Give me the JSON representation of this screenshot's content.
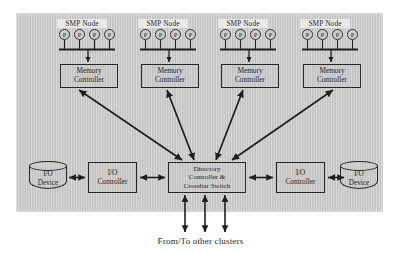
{
  "figure": {
    "caption": "From/To other clusters",
    "panel_color": "#c9c9c9",
    "line_color": "#262626"
  },
  "smp_nodes": [
    {
      "label": "SMP Node",
      "processors": [
        "P",
        "P",
        "P",
        "P"
      ],
      "memory_controller": {
        "line1": "Memory",
        "line2": "Controller"
      }
    },
    {
      "label": "SMP Node",
      "processors": [
        "P",
        "P",
        "P",
        "P"
      ],
      "memory_controller": {
        "line1": "Memory",
        "line2": "Controller"
      }
    },
    {
      "label": "SMP Node",
      "processors": [
        "P",
        "P",
        "P",
        "P"
      ],
      "memory_controller": {
        "line1": "Memory",
        "line2": "Controller"
      }
    },
    {
      "label": "SMP Node",
      "processors": [
        "P",
        "P",
        "P",
        "P"
      ],
      "memory_controller": {
        "line1": "Memory",
        "line2": "Controller"
      }
    }
  ],
  "directory": {
    "line1": "Directory",
    "line2": "Controller &",
    "line3": "Crossbar Switch"
  },
  "io_left": {
    "controller": {
      "line1": "I/O",
      "line2": "Controller"
    },
    "device": {
      "line1": "I/O",
      "line2": "Device"
    }
  },
  "io_right": {
    "controller": {
      "line1": "I/O",
      "line2": "Controller"
    },
    "device": {
      "line1": "I/O",
      "line2": "Device"
    }
  },
  "external_links": {
    "count": 3,
    "label": "From/To other clusters"
  }
}
